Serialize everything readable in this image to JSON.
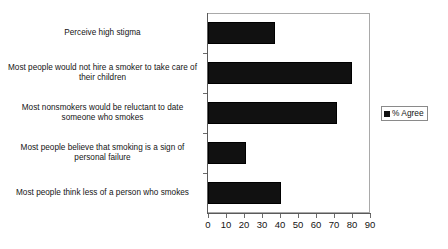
{
  "chart_data": {
    "type": "bar",
    "orientation": "horizontal",
    "title": "",
    "subtitle": "",
    "xlabel": "",
    "ylabel": "",
    "xlim": [
      0,
      90
    ],
    "xticks": [
      "0",
      "10",
      "20",
      "30",
      "40",
      "50",
      "60",
      "70",
      "80",
      "90"
    ],
    "xtick_values": [
      0,
      10,
      20,
      30,
      40,
      50,
      60,
      70,
      80,
      90
    ],
    "grid": false,
    "legend_position": "right",
    "categories": [
      "Perceive high stigma",
      "Most people would not hire a smoker to take care of their children",
      "Most nonsmokers would be reluctant to date someone who smokes",
      "Most people believe that smoking is a sign of personal failure",
      "Most people think less of a person who smokes"
    ],
    "series": [
      {
        "name": "% Agree",
        "color": "#111111",
        "values": [
          37,
          80,
          71.5,
          21,
          40.5
        ]
      }
    ]
  },
  "legend": {
    "entries": [
      {
        "label": "% Agree",
        "marker": "square-marker",
        "color": "#111111"
      }
    ]
  },
  "colors": {
    "bar": "#111111",
    "axis": "#5a5a5a",
    "frame": "#a9a9a9",
    "text": "#141414",
    "background": "#ffffff"
  }
}
